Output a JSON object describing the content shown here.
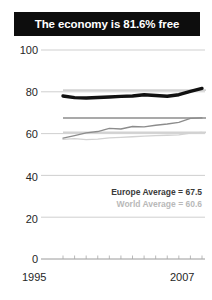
{
  "title": {
    "text": "The economy is 81.6% free"
  },
  "legend": {
    "europe_label": "Europe Average = 67.5",
    "world_label": "World Average = 60.6"
  },
  "axis": {
    "y_ticks": [
      "100",
      "80",
      "60",
      "40",
      "20",
      "0"
    ],
    "x_start": "1995",
    "x_end": "2007"
  },
  "colors": {
    "title_bar": "#0d0d0d",
    "title_text": "#ffffff",
    "country_line": "#111111",
    "europe_line": "#8c8c8c",
    "world_line": "#d2d2d2",
    "gridline": "#c9c9c9",
    "tick_text": "#262626"
  },
  "chart_data": {
    "type": "line",
    "title": "The economy is 81.6% free",
    "xlabel": "",
    "ylabel": "",
    "ylim": [
      0,
      100
    ],
    "yticks": [
      0,
      20,
      40,
      60,
      80,
      100
    ],
    "grid": true,
    "legend_position": "inside-right",
    "x": [
      1995,
      1996,
      1997,
      1998,
      1999,
      2000,
      2001,
      2002,
      2003,
      2004,
      2005,
      2006,
      2007
    ],
    "series": [
      {
        "name": "Country score",
        "color": "#111111",
        "values": [
          78.0,
          77.2,
          77.0,
          77.3,
          77.5,
          77.8,
          78.0,
          78.6,
          78.2,
          77.9,
          78.6,
          80.2,
          81.6
        ]
      },
      {
        "name": "Europe Average",
        "color": "#8c8c8c",
        "values": [
          57.8,
          59.0,
          60.3,
          61.0,
          62.5,
          62.2,
          63.4,
          63.2,
          64.0,
          64.6,
          65.4,
          67.3,
          67.5
        ]
      },
      {
        "name": "World Average",
        "color": "#d2d2d2",
        "values": [
          57.2,
          57.6,
          57.1,
          57.4,
          58.0,
          58.2,
          58.5,
          58.8,
          59.0,
          59.2,
          59.4,
          60.2,
          60.6
        ]
      }
    ],
    "reference_markers": [
      {
        "name": "Europe Average marker",
        "value": 67.5,
        "color": "#8c8c8c"
      },
      {
        "name": "World Average marker",
        "value": 60.6,
        "color": "#d2d2d2"
      },
      {
        "name": "Country top guide",
        "value": 80.8,
        "color": "#d2d2d2"
      }
    ]
  }
}
